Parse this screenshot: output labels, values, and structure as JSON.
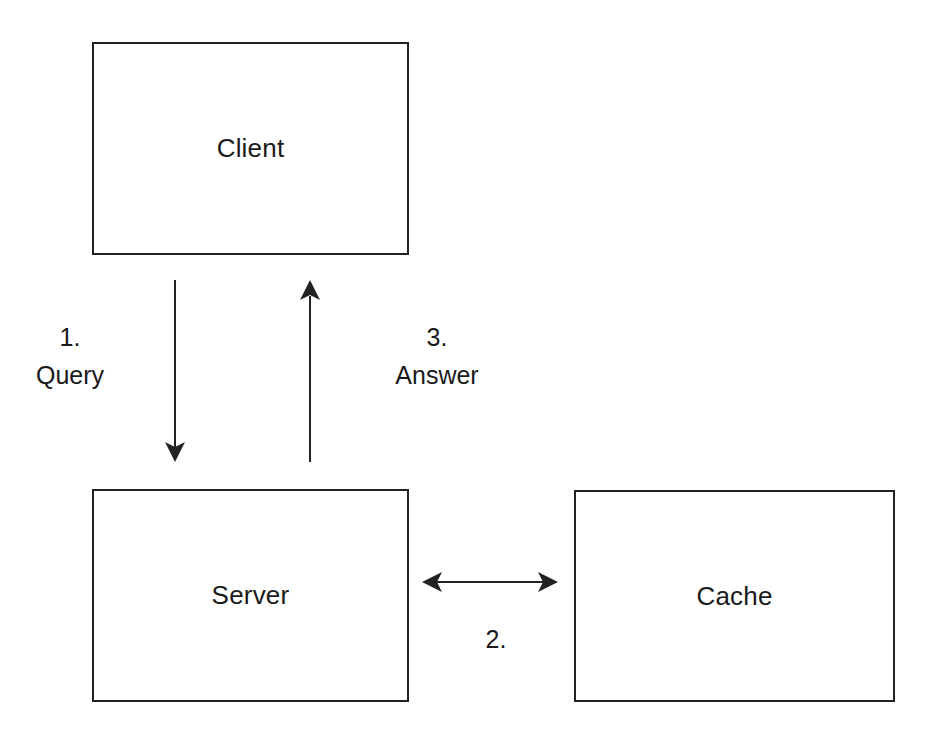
{
  "diagram": {
    "nodes": [
      {
        "id": "client",
        "label": "Client"
      },
      {
        "id": "server",
        "label": "Server"
      },
      {
        "id": "cache",
        "label": "Cache"
      }
    ],
    "edges": [
      {
        "from": "client",
        "to": "server",
        "step": "1.",
        "label": "Query"
      },
      {
        "from": "server",
        "to": "cache",
        "step": "2.",
        "label": "",
        "bidirectional": true
      },
      {
        "from": "server",
        "to": "client",
        "step": "3.",
        "label": "Answer"
      }
    ],
    "colors": {
      "stroke": "#222222",
      "background": "#ffffff",
      "text": "#1a1a1a"
    }
  }
}
